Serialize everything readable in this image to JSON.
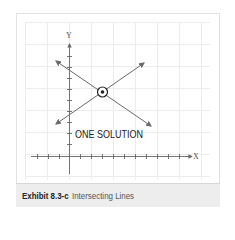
{
  "exhibit": {
    "number": "Exhibit 8.3-c",
    "title": "Intersecting Lines"
  },
  "diagram": {
    "axis_x_label": "X",
    "axis_y_label": "Y",
    "annotation": "ONE SOLUTION",
    "intersection_marker": "circled-dot",
    "lines": [
      {
        "name": "decreasing-line",
        "from": [
          53,
          59
        ],
        "to": [
          153,
          127
        ]
      },
      {
        "name": "increasing-line",
        "from": [
          54,
          126
        ],
        "to": [
          146,
          62
        ]
      }
    ],
    "intersection_point": [
      102,
      92
    ],
    "colors": {
      "line": "#6b6b6b",
      "axis": "#555555",
      "grid": "#ececec",
      "caption_bg": "#ededed"
    }
  }
}
